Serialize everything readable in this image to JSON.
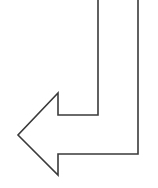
{
  "diagram": {
    "shape": "bent-arrow-down-then-left",
    "direction": "left",
    "stroke_color": "#3a3a3a",
    "fill_color": "#ffffff",
    "stroke_width": 1.6,
    "points": "98,0 98,115 58,115 58,93 18,135 58,175 58,154 138,154 138,0"
  }
}
